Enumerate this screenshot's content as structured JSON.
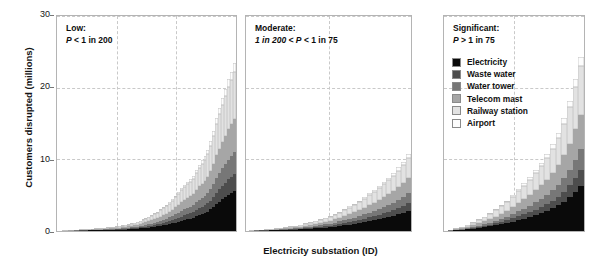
{
  "chart_data": {
    "type": "bar",
    "stacked": true,
    "title": "",
    "xlabel": "Electricity substation (ID)",
    "ylabel": "Customers disrupted (millions)",
    "ylim": [
      0,
      30
    ],
    "yticks": [
      0,
      10,
      20,
      30
    ],
    "grid": "dashed-both",
    "legend_position": "top-right-inside-panel-3",
    "series": [
      {
        "name": "Electricity",
        "color": "#0a0a0a"
      },
      {
        "name": "Waste water",
        "color": "#4d4d4d"
      },
      {
        "name": "Water tower",
        "color": "#777777"
      },
      {
        "name": "Telecom mast",
        "color": "#a6a6a6"
      },
      {
        "name": "Railway station",
        "color": "#e2e2e2"
      },
      {
        "name": "Airport",
        "color": "#fdfdfd"
      }
    ],
    "panels": [
      {
        "id": "low",
        "title_line1": "Low:",
        "title_line2_pre": "P",
        "title_line2_post": " < 1 in 200",
        "totals": [
          0.05,
          0.08,
          0.1,
          0.12,
          0.15,
          0.18,
          0.2,
          0.22,
          0.25,
          0.28,
          0.3,
          0.33,
          0.36,
          0.4,
          0.43,
          0.47,
          0.5,
          0.55,
          0.6,
          0.65,
          0.7,
          0.78,
          0.85,
          0.95,
          1.05,
          1.15,
          1.3,
          1.45,
          1.6,
          1.8,
          2.0,
          2.2,
          2.45,
          2.7,
          3.0,
          3.3,
          3.6,
          4.0,
          4.4,
          4.9,
          5.4,
          5.9,
          6.4,
          6.8,
          7.2,
          7.6,
          8.4,
          9.2,
          9.8,
          10.4,
          11.2,
          12.4,
          13.8,
          15.6,
          17.0,
          18.4,
          19.6,
          21.0,
          22.0,
          23.2
        ],
        "fractions": [
          0.24,
          0.1,
          0.13,
          0.2,
          0.28,
          0.05
        ]
      },
      {
        "id": "moderate",
        "title_line1": "Moderate:",
        "title_line2_pre": "1 in 200 < P",
        "title_line2_post": " < 1 in 75",
        "totals": [
          0.1,
          0.15,
          0.2,
          0.25,
          0.3,
          0.38,
          0.45,
          0.55,
          0.65,
          0.75,
          0.9,
          1.05,
          1.2,
          1.4,
          1.6,
          1.85,
          2.1,
          2.4,
          2.7,
          3.0,
          3.4,
          3.8,
          4.2,
          4.7,
          5.2,
          5.7,
          6.2,
          6.8,
          7.4,
          8.0,
          8.8,
          9.6,
          10.6
        ],
        "fractions": [
          0.26,
          0.1,
          0.13,
          0.2,
          0.26,
          0.05
        ]
      },
      {
        "id": "significant",
        "title_line1": "Significant:",
        "title_line2_pre": "P",
        "title_line2_post": " > 1 in 75",
        "totals": [
          0.2,
          0.4,
          0.6,
          0.9,
          1.2,
          1.6,
          2.0,
          2.5,
          3.0,
          3.6,
          4.2,
          5.0,
          5.8,
          6.6,
          7.5,
          8.4,
          9.4,
          10.6,
          12.0,
          13.6,
          15.6,
          18.0,
          21.0,
          24.0
        ],
        "fractions": [
          0.26,
          0.09,
          0.12,
          0.2,
          0.28,
          0.05
        ]
      }
    ]
  }
}
